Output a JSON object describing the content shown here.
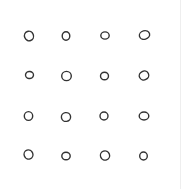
{
  "figure": {
    "rows": 4,
    "cols": 4,
    "stroke_color": "#333333",
    "background": "#ffffff",
    "circles": [
      {
        "row": 0,
        "col": 0,
        "cx": 29,
        "cy": 36,
        "rx": 4.5,
        "ry": 4.8,
        "rot": -20
      },
      {
        "row": 0,
        "col": 1,
        "cx": 66,
        "cy": 36,
        "rx": 3.8,
        "ry": 4.2,
        "rot": 0
      },
      {
        "row": 0,
        "col": 2,
        "cx": 105,
        "cy": 35.5,
        "rx": 4.2,
        "ry": 3.6,
        "rot": 0
      },
      {
        "row": 0,
        "col": 3,
        "cx": 144.5,
        "cy": 35,
        "rx": 5.2,
        "ry": 4.2,
        "rot": -15
      },
      {
        "row": 1,
        "col": 0,
        "cx": 29.5,
        "cy": 75,
        "rx": 4.0,
        "ry": 3.5,
        "rot": 10
      },
      {
        "row": 1,
        "col": 1,
        "cx": 66.5,
        "cy": 76,
        "rx": 4.8,
        "ry": 4.6,
        "rot": 0
      },
      {
        "row": 1,
        "col": 2,
        "cx": 104.5,
        "cy": 76,
        "rx": 4.0,
        "ry": 3.8,
        "rot": 0
      },
      {
        "row": 1,
        "col": 3,
        "cx": 144,
        "cy": 75.5,
        "rx": 4.8,
        "ry": 4.4,
        "rot": -25
      },
      {
        "row": 2,
        "col": 0,
        "cx": 28.5,
        "cy": 116,
        "rx": 4.2,
        "ry": 4.4,
        "rot": 0
      },
      {
        "row": 2,
        "col": 1,
        "cx": 66,
        "cy": 117,
        "rx": 4.6,
        "ry": 4.4,
        "rot": -10
      },
      {
        "row": 2,
        "col": 2,
        "cx": 104,
        "cy": 116,
        "rx": 4.0,
        "ry": 4.0,
        "rot": 0
      },
      {
        "row": 2,
        "col": 3,
        "cx": 144,
        "cy": 116,
        "rx": 4.8,
        "ry": 4.0,
        "rot": 0
      },
      {
        "row": 3,
        "col": 0,
        "cx": 28.5,
        "cy": 154.5,
        "rx": 4.4,
        "ry": 4.6,
        "rot": -20
      },
      {
        "row": 3,
        "col": 1,
        "cx": 66,
        "cy": 156,
        "rx": 4.2,
        "ry": 3.8,
        "rot": 0
      },
      {
        "row": 3,
        "col": 2,
        "cx": 105,
        "cy": 155.5,
        "rx": 4.6,
        "ry": 4.6,
        "rot": -20
      },
      {
        "row": 3,
        "col": 3,
        "cx": 143.5,
        "cy": 156,
        "rx": 3.8,
        "ry": 4.0,
        "rot": 0
      }
    ]
  }
}
